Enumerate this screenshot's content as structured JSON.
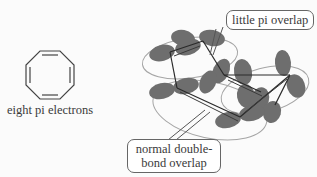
{
  "left_panel": {
    "structure": "cyclooctatetraene",
    "caption": "eight pi electrons"
  },
  "callouts": {
    "top": "little pi overlap",
    "bottom_line1": "normal double-",
    "bottom_line2": "bond overlap"
  },
  "colors": {
    "lobe": "#6b6b6b",
    "bond": "#2a2a2a",
    "orbit_ring": "#9a9a9a",
    "callout_border": "#666666"
  }
}
